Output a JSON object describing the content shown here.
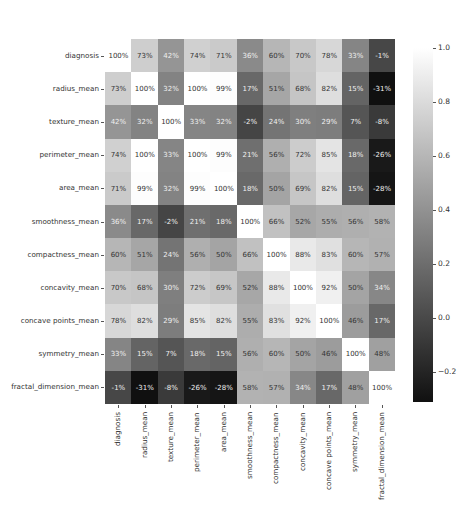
{
  "chart_data": {
    "type": "heatmap",
    "title": "",
    "xlabel": "",
    "ylabel": "",
    "annotation_format": "percent",
    "colormap": "grayscale (dark = low, white = high)",
    "colorbar": {
      "range": [
        -0.31,
        1.0
      ],
      "ticks": [
        "1.0",
        "0.8",
        "0.6",
        "0.4",
        "0.2",
        "0.0",
        "−0.2"
      ],
      "tick_values": [
        1.0,
        0.8,
        0.6,
        0.4,
        0.2,
        0.0,
        -0.2
      ],
      "position": "right"
    },
    "rows": [
      "diagnosis",
      "radius_mean",
      "texture_mean",
      "perimeter_mean",
      "area_mean",
      "smoothness_mean",
      "compactness_mean",
      "concavity_mean",
      "concave points_mean",
      "symmetry_mean",
      "fractal_dimension_mean"
    ],
    "columns": [
      "diagnosis",
      "radius_mean",
      "texture_mean",
      "perimeter_mean",
      "area_mean",
      "smoothness_mean",
      "compactness_mean",
      "concavity_mean",
      "concave points_mean",
      "symmetry_mean",
      "fractal_dimension_mean"
    ],
    "values": [
      [
        1.0,
        0.73,
        0.42,
        0.74,
        0.71,
        0.36,
        0.6,
        0.7,
        0.78,
        0.33,
        -0.01
      ],
      [
        0.73,
        1.0,
        0.32,
        1.0,
        0.99,
        0.17,
        0.51,
        0.68,
        0.82,
        0.15,
        -0.31
      ],
      [
        0.42,
        0.32,
        1.0,
        0.33,
        0.32,
        -0.02,
        0.24,
        0.3,
        0.29,
        0.07,
        -0.08
      ],
      [
        0.74,
        1.0,
        0.33,
        1.0,
        0.99,
        0.21,
        0.56,
        0.72,
        0.85,
        0.18,
        -0.26
      ],
      [
        0.71,
        0.99,
        0.32,
        0.99,
        1.0,
        0.18,
        0.5,
        0.69,
        0.82,
        0.15,
        -0.28
      ],
      [
        0.36,
        0.17,
        -0.02,
        0.21,
        0.18,
        1.0,
        0.66,
        0.52,
        0.55,
        0.56,
        0.58
      ],
      [
        0.6,
        0.51,
        0.24,
        0.56,
        0.5,
        0.66,
        1.0,
        0.88,
        0.83,
        0.6,
        0.57
      ],
      [
        0.7,
        0.68,
        0.3,
        0.72,
        0.69,
        0.52,
        0.88,
        1.0,
        0.92,
        0.5,
        0.34
      ],
      [
        0.78,
        0.82,
        0.29,
        0.85,
        0.82,
        0.55,
        0.83,
        0.92,
        1.0,
        0.46,
        0.17
      ],
      [
        0.33,
        0.15,
        0.07,
        0.18,
        0.15,
        0.56,
        0.6,
        0.5,
        0.46,
        1.0,
        0.48
      ],
      [
        -0.01,
        -0.31,
        -0.08,
        -0.26,
        -0.28,
        0.58,
        0.57,
        0.34,
        0.17,
        0.48,
        1.0
      ]
    ],
    "legend": "colorbar",
    "grid": false
  }
}
